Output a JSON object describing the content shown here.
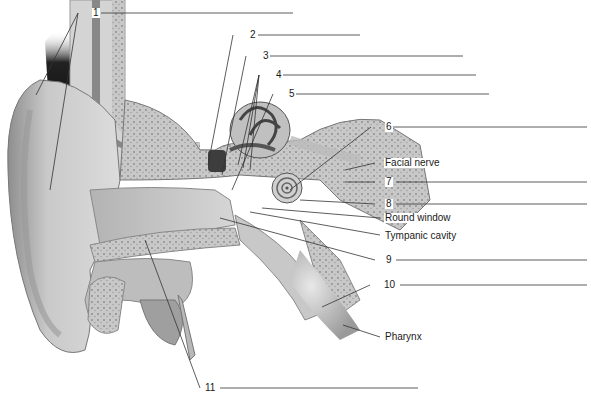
{
  "diagram": {
    "numbered_labels": [
      {
        "id": "1",
        "text": "1",
        "answer_line": true
      },
      {
        "id": "2",
        "text": "2",
        "answer_line": true
      },
      {
        "id": "3",
        "text": "3",
        "answer_line": true
      },
      {
        "id": "4",
        "text": "4",
        "answer_line": true
      },
      {
        "id": "5",
        "text": "5",
        "answer_line": true
      },
      {
        "id": "6",
        "text": "6",
        "answer_line": true
      },
      {
        "id": "7",
        "text": "7",
        "answer_line": true
      },
      {
        "id": "8",
        "text": "8",
        "answer_line": true
      },
      {
        "id": "9",
        "text": "9",
        "answer_line": true
      },
      {
        "id": "10",
        "text": "10",
        "answer_line": true
      },
      {
        "id": "11",
        "text": "11",
        "answer_line": true
      }
    ],
    "named_labels": [
      {
        "id": "facial-nerve",
        "text": "Facial nerve"
      },
      {
        "id": "round-window",
        "text": "Round window"
      },
      {
        "id": "tympanic-cavity",
        "text": "Tympanic cavity"
      },
      {
        "id": "pharynx",
        "text": "Pharynx"
      }
    ],
    "colors": {
      "background": "#ffffff",
      "leader_line": "#333333",
      "tissue_light": "#d9d9d9",
      "tissue_mid": "#a8a8a8",
      "tissue_dark": "#555555",
      "bone": "#bdbdbd"
    }
  }
}
